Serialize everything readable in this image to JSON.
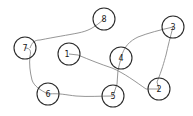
{
  "diagram": {
    "type": "graph",
    "colors": {
      "background": "#ffffff",
      "node_stroke": "#2b2b2b",
      "edge_stroke": "#8a8a8a",
      "label": "#1a1a1a"
    },
    "nodes": [
      {
        "id": "1",
        "label": "1",
        "x": 69,
        "y": 54,
        "r": 11
      },
      {
        "id": "2",
        "label": "2",
        "x": 159,
        "y": 89,
        "r": 11
      },
      {
        "id": "3",
        "label": "3",
        "x": 173,
        "y": 27,
        "r": 11
      },
      {
        "id": "4",
        "label": "4",
        "x": 121,
        "y": 58,
        "r": 11
      },
      {
        "id": "5",
        "label": "5",
        "x": 113,
        "y": 96,
        "r": 11
      },
      {
        "id": "6",
        "label": "6",
        "x": 48,
        "y": 94,
        "r": 11
      },
      {
        "id": "7",
        "label": "7",
        "x": 25,
        "y": 48,
        "r": 11
      },
      {
        "id": "8",
        "label": "8",
        "x": 104,
        "y": 19,
        "r": 11
      }
    ],
    "edges": [
      {
        "from": "1",
        "to": "2"
      },
      {
        "from": "2",
        "to": "3"
      },
      {
        "from": "3",
        "to": "4"
      },
      {
        "from": "4",
        "to": "5"
      },
      {
        "from": "5",
        "to": "6"
      },
      {
        "from": "6",
        "to": "7"
      },
      {
        "from": "7",
        "to": "8"
      }
    ]
  }
}
